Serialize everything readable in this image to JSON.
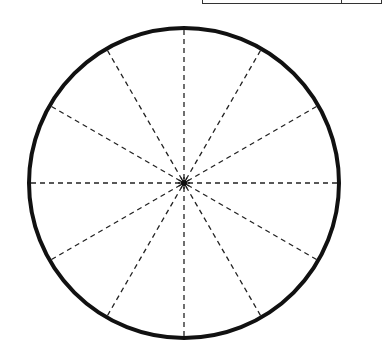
{
  "diagram": {
    "type": "circle-divided-into-sectors",
    "sector_count": 12,
    "sector_angle_degrees": 30,
    "circle": {
      "cx": 184,
      "cy": 183,
      "r": 155,
      "stroke": "#111111",
      "stroke_width": 4
    },
    "spokes": {
      "style": "dashed",
      "stroke": "#222222",
      "count": 12,
      "length": 153
    },
    "center_marker": "starburst-dot"
  },
  "table_fragment": {
    "visible": true,
    "note": "partial table border cropped at top-right"
  }
}
